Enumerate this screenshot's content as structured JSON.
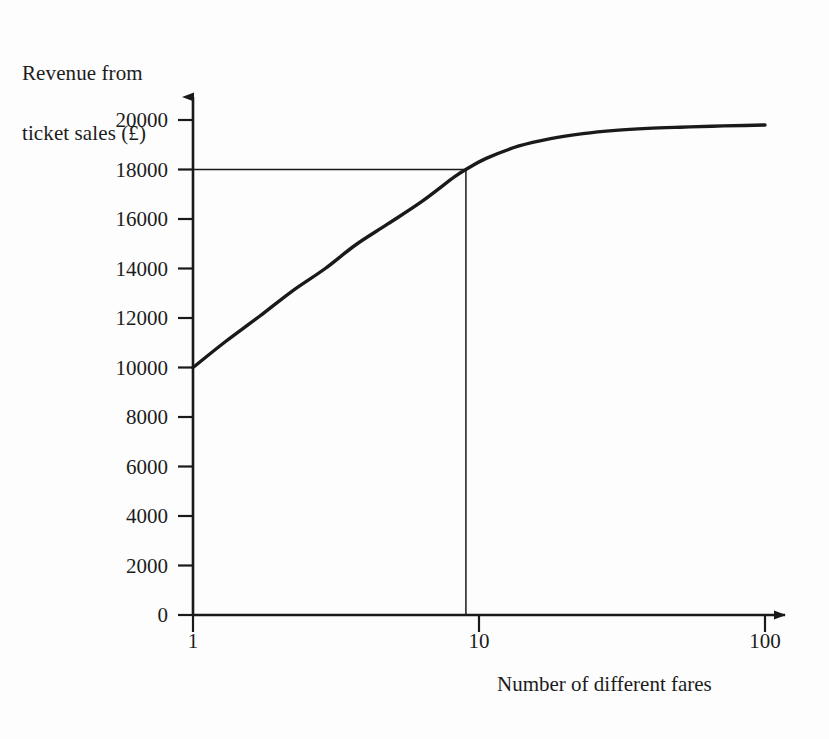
{
  "chart_data": {
    "type": "line",
    "title": "",
    "subtitle": "",
    "xlabel": "Number of different fares",
    "ylabel": "Revenue from\nticket sales (£)",
    "ylabel_line1": "Revenue from",
    "ylabel_line2": "ticket sales (£)",
    "x_scale": "log",
    "y_scale": "linear",
    "xlim": [
      1,
      100
    ],
    "ylim": [
      0,
      20000
    ],
    "grid": false,
    "legend": null,
    "x_tick_labels": [
      "1",
      "10",
      "100"
    ],
    "x_tick_values": [
      1,
      10,
      100
    ],
    "y_tick_labels": [
      "0",
      "2000",
      "4000",
      "6000",
      "8000",
      "10000",
      "12000",
      "14000",
      "16000",
      "18000",
      "20000"
    ],
    "y_tick_values": [
      0,
      2000,
      4000,
      6000,
      8000,
      10000,
      12000,
      14000,
      16000,
      18000,
      20000
    ],
    "series": [
      {
        "name": "Revenue from ticket sales",
        "color": "#1a1a1a",
        "x": [
          1,
          1.3,
          1.7,
          2.2,
          2.9,
          3.7,
          4.8,
          6.3,
          8.2,
          9.0,
          10.6,
          13.8,
          17.8,
          23.1,
          30.0,
          38.9,
          50.4,
          65.3,
          84.7,
          100
        ],
        "values": [
          10000,
          11050,
          12050,
          13050,
          14000,
          14950,
          15800,
          16700,
          17700,
          18000,
          18450,
          18950,
          19250,
          19450,
          19580,
          19660,
          19710,
          19750,
          19780,
          19800
        ]
      }
    ],
    "annotations": [
      {
        "name": "guide-line-horizontal",
        "kind": "reference-line",
        "orientation": "horizontal",
        "y_value": 18000,
        "from_x": 1,
        "to_x": 9.0,
        "color": "#1a1a1a"
      },
      {
        "name": "guide-line-vertical",
        "kind": "reference-line",
        "orientation": "vertical",
        "x_value": 9.0,
        "from_y": 0,
        "to_y": 18000,
        "color": "#1a1a1a"
      }
    ],
    "readoff": {
      "x_value": 9.0,
      "y_value": 18000,
      "note": "Revenue of 18000 reached at approximately 9 different fares"
    }
  },
  "axes": {
    "y_axis_name": "revenue-axis",
    "x_axis_name": "fares-axis",
    "arrow_heads": true,
    "axis_color": "#1a1a1a"
  }
}
